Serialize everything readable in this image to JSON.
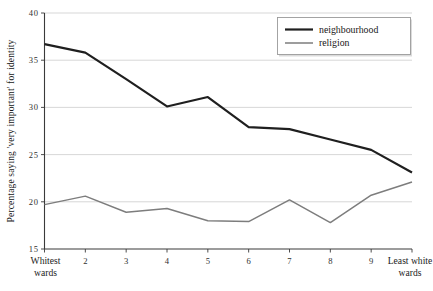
{
  "chart_data": {
    "type": "line",
    "title": "",
    "xlabel": "",
    "ylabel": "Percentage saying 'very important' for identity",
    "categories": [
      "Whitest wards",
      "2",
      "3",
      "4",
      "5",
      "6",
      "7",
      "8",
      "9",
      "Least white wards"
    ],
    "tick_labels_x": [
      "Whitest\nwards",
      "2",
      "3",
      "4",
      "5",
      "6",
      "7",
      "8",
      "9",
      "Least white\nwards"
    ],
    "ylim": [
      15,
      40
    ],
    "yticks": [
      15,
      20,
      25,
      30,
      35,
      40
    ],
    "ytick_labels": [
      "15",
      "20",
      "25",
      "30",
      "35",
      "40"
    ],
    "grid": true,
    "grid_axis": "y",
    "legend_position": "top-right",
    "series": [
      {
        "name": "neighbourhood",
        "color": "#1f1f1f",
        "width": 2.2,
        "values": [
          36.7,
          35.8,
          33.0,
          30.1,
          31.1,
          27.9,
          27.7,
          26.6,
          25.5,
          23.1
        ]
      },
      {
        "name": "religion",
        "color": "#7d7d7d",
        "width": 1.5,
        "values": [
          19.7,
          20.6,
          18.9,
          19.3,
          18.0,
          17.9,
          20.2,
          17.8,
          20.7,
          22.1
        ]
      }
    ]
  },
  "axis": {
    "x_label_first_line1": "Whitest",
    "x_label_first_line2": "wards",
    "x_label_last_line1": "Least white",
    "x_label_last_line2": "wards"
  },
  "legend": {
    "items": [
      {
        "label": "neighbourhood"
      },
      {
        "label": "religion"
      }
    ]
  }
}
